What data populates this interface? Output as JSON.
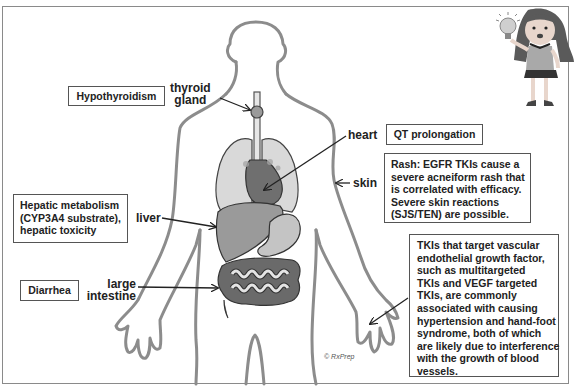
{
  "diagram": {
    "credit": "© RxPrep",
    "colors": {
      "outline": "#8c8c8c",
      "lung": "#d9d9d9",
      "heart": "#6f6f6f",
      "liver": "#9a9a9a",
      "stomach": "#c4c4c4",
      "large_intestine": "#6a6a6a",
      "small_intestine": "#dcdcdc",
      "box_border": "#555555",
      "frame": "#8a8a8a"
    },
    "organ_labels": {
      "thyroid": [
        "thyroid",
        "gland"
      ],
      "heart": "heart",
      "skin": "skin",
      "liver": "liver",
      "large_intestine": [
        "large",
        "intestine"
      ]
    },
    "effect_boxes": {
      "hypothyroidism": "Hypothyroidism",
      "qt": "QT prolongation",
      "rash": [
        "Rash: EGFR TKIs cause a",
        "severe acneiform rash that",
        "is correlated with efficacy.",
        "Severe skin reactions",
        "(SJS/TEN) are possible."
      ],
      "hepatic": [
        "Hepatic metabolism",
        "(CYP3A4 substrate),",
        "hepatic toxicity"
      ],
      "diarrhea": "Diarrhea",
      "vegf": [
        "TKIs that target vascular",
        "endothelial growth factor,",
        "such as multitargeted",
        "TKIs and VEGF targeted",
        "TKIs, are commonly",
        "associated with causing",
        "hypertension and hand-foot",
        "syndrome, both of which",
        "are likely due to interference",
        "with the growth of blood",
        "vessels."
      ]
    },
    "mascot": {
      "icon": "girl-with-lightbulb-icon"
    }
  }
}
